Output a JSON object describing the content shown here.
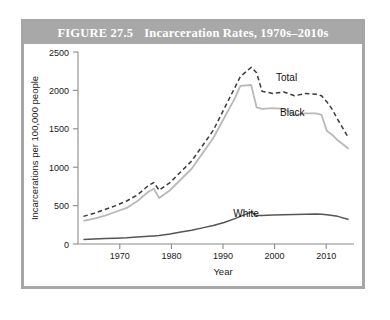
{
  "figure": {
    "number_label": "FIGURE 27.5",
    "title": "Incarceration Rates, 1970s–2010s"
  },
  "chart_data": {
    "type": "line",
    "title": "Incarceration Rates, 1970s–2010s",
    "xlabel": "Year",
    "ylabel": "Incarcerations per 100,000 people",
    "xlim": [
      1962,
      2013
    ],
    "ylim": [
      0,
      2500
    ],
    "xticks": [
      1970,
      1980,
      1990,
      2000,
      2010
    ],
    "xtick_labels": [
      "1970",
      "1980",
      "1990",
      "2000",
      "2010"
    ],
    "yticks": [
      0,
      500,
      1000,
      1500,
      2000,
      2500
    ],
    "ytick_labels": [
      "0",
      "500",
      "1000",
      "1500",
      "2000",
      "2500"
    ],
    "grid": false,
    "legend_position": "inline-annotations",
    "x": [
      1963,
      1965,
      1967,
      1969,
      1971,
      1973,
      1975,
      1976,
      1977,
      1979,
      1981,
      1983,
      1985,
      1987,
      1989,
      1991,
      1992,
      1994,
      1995,
      1996,
      1998,
      2000,
      2002,
      2004,
      2006,
      2007,
      2008,
      2009,
      2010,
      2012
    ],
    "series": [
      {
        "name": "Total",
        "style": "dashed",
        "color": "#3a3a3a",
        "label_text": "Total",
        "values": [
          360,
          400,
          450,
          500,
          560,
          640,
          760,
          800,
          700,
          800,
          940,
          1080,
          1280,
          1480,
          1760,
          2040,
          2180,
          2300,
          2230,
          1990,
          1960,
          1980,
          1930,
          1960,
          1950,
          1930,
          1850,
          1750,
          1620,
          1380
        ]
      },
      {
        "name": "Black",
        "style": "solid",
        "color": "#b9b9b9",
        "label_text": "Black",
        "values": [
          300,
          330,
          370,
          420,
          470,
          560,
          680,
          720,
          600,
          700,
          840,
          980,
          1180,
          1380,
          1640,
          1900,
          2060,
          2070,
          1780,
          1760,
          1770,
          1760,
          1680,
          1700,
          1700,
          1680,
          1470,
          1420,
          1350,
          1240
        ]
      },
      {
        "name": "White",
        "style": "solid",
        "color": "#555555",
        "label_text": "White",
        "values": [
          60,
          65,
          70,
          75,
          80,
          90,
          100,
          105,
          110,
          130,
          155,
          180,
          210,
          240,
          280,
          330,
          360,
          415,
          370,
          372,
          378,
          382,
          385,
          388,
          390,
          388,
          382,
          372,
          360,
          320
        ]
      }
    ]
  }
}
